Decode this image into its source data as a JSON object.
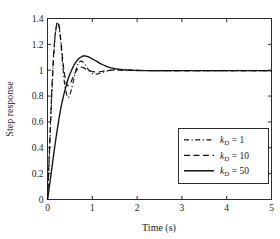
{
  "chart_data": {
    "type": "line",
    "title": "",
    "xlabel": "Time (s)",
    "ylabel": "Step response",
    "xlim": [
      0,
      5
    ],
    "ylim": [
      0,
      1.4
    ],
    "xticks": [
      0,
      1,
      2,
      3,
      4,
      5
    ],
    "xtick_labels": [
      "0",
      "1",
      "2",
      "3",
      "4",
      "5"
    ],
    "yticks": [
      0,
      0.2,
      0.4,
      0.6,
      0.8,
      1,
      1.2,
      1.4
    ],
    "ytick_labels": [
      "0",
      "0.2",
      "0.4",
      "0.6",
      "0.8",
      "1",
      "1.2",
      "1.4"
    ],
    "grid": false,
    "legend_position": "lower right",
    "legend": [
      {
        "label": "k_D = 1",
        "k_symbol": "k",
        "subscript": "D",
        "equals_value": "= 1",
        "style": "dashdot"
      },
      {
        "label": "k_D = 10",
        "k_symbol": "k",
        "subscript": "D",
        "equals_value": "= 10",
        "style": "dashed"
      },
      {
        "label": "k_D = 50",
        "k_symbol": "k",
        "subscript": "D",
        "equals_value": "= 50",
        "style": "solid"
      }
    ],
    "series": [
      {
        "name": "k_D = 1",
        "style": "dashdot",
        "x": [
          0,
          0.02,
          0.05,
          0.08,
          0.11,
          0.14,
          0.17,
          0.2,
          0.23,
          0.26,
          0.29,
          0.32,
          0.35,
          0.38,
          0.41,
          0.44,
          0.47,
          0.5,
          0.54,
          0.58,
          0.62,
          0.66,
          0.7,
          0.75,
          0.8,
          0.85,
          0.9,
          0.95,
          1.0,
          1.1,
          1.2,
          1.3,
          1.4,
          1.5,
          1.7,
          1.9,
          2.1,
          2.4,
          2.8,
          3.2,
          3.6,
          4.0,
          4.5,
          5.0
        ],
        "y": [
          0,
          0.16,
          0.42,
          0.68,
          0.92,
          1.12,
          1.26,
          1.34,
          1.37,
          1.33,
          1.24,
          1.12,
          1.0,
          0.9,
          0.84,
          0.8,
          0.79,
          0.81,
          0.86,
          0.92,
          0.98,
          1.03,
          1.06,
          1.07,
          1.06,
          1.04,
          1.01,
          0.99,
          0.975,
          0.97,
          0.98,
          0.99,
          1.0,
          1.005,
          1.005,
          1.0,
          0.998,
          0.997,
          0.997,
          0.997,
          0.997,
          0.997,
          0.997,
          0.997
        ]
      },
      {
        "name": "k_D = 10",
        "style": "dashed",
        "x": [
          0,
          0.02,
          0.05,
          0.08,
          0.11,
          0.14,
          0.17,
          0.2,
          0.23,
          0.26,
          0.29,
          0.32,
          0.35,
          0.38,
          0.42,
          0.46,
          0.5,
          0.55,
          0.6,
          0.65,
          0.7,
          0.75,
          0.8,
          0.85,
          0.9,
          0.95,
          1.0,
          1.1,
          1.2,
          1.3,
          1.4,
          1.5,
          1.7,
          1.9,
          2.1,
          2.4,
          2.8,
          3.2,
          3.6,
          4.0,
          4.5,
          5.0
        ],
        "y": [
          0,
          0.17,
          0.44,
          0.71,
          0.95,
          1.14,
          1.27,
          1.345,
          1.37,
          1.34,
          1.26,
          1.15,
          1.05,
          0.97,
          0.9,
          0.88,
          0.89,
          0.93,
          0.97,
          1.0,
          1.02,
          1.025,
          1.02,
          1.01,
          1.0,
          0.995,
          0.99,
          0.985,
          0.99,
          0.995,
          1.0,
          1.0,
          1.0,
          0.999,
          0.998,
          0.997,
          0.997,
          0.997,
          0.997,
          0.997,
          0.997,
          0.997
        ]
      },
      {
        "name": "k_D = 50",
        "style": "solid",
        "x": [
          0,
          0.05,
          0.1,
          0.15,
          0.2,
          0.25,
          0.3,
          0.35,
          0.4,
          0.45,
          0.5,
          0.55,
          0.6,
          0.65,
          0.7,
          0.75,
          0.8,
          0.85,
          0.9,
          0.95,
          1.0,
          1.1,
          1.2,
          1.3,
          1.4,
          1.5,
          1.6,
          1.8,
          2.0,
          2.2,
          2.5,
          3.0,
          3.5,
          4.0,
          4.5,
          5.0
        ],
        "y": [
          0,
          0.12,
          0.25,
          0.38,
          0.5,
          0.61,
          0.71,
          0.79,
          0.86,
          0.92,
          0.97,
          1.01,
          1.045,
          1.07,
          1.09,
          1.102,
          1.11,
          1.11,
          1.105,
          1.098,
          1.088,
          1.068,
          1.048,
          1.032,
          1.02,
          1.012,
          1.007,
          1.0,
          0.998,
          0.997,
          0.997,
          0.997,
          0.997,
          0.997,
          0.997,
          0.997
        ]
      }
    ]
  },
  "axes": {
    "x_title": "Time (s)",
    "y_title": "Step response"
  }
}
